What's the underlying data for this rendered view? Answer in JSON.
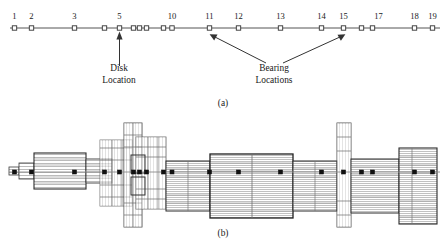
{
  "figure": {
    "panel_a": {
      "caption": "(a)",
      "description": "lumped-mass node line model of rotor",
      "node_labels": [
        {
          "id": "1",
          "x": 14.5
        },
        {
          "id": "2",
          "x": 31.5
        },
        {
          "id": "3",
          "x": 74.5
        },
        {
          "id": "5",
          "x": 119.5
        },
        {
          "id": "10",
          "x": 172.0
        },
        {
          "id": "11",
          "x": 209.5
        },
        {
          "id": "12",
          "x": 238.5
        },
        {
          "id": "13",
          "x": 280.5
        },
        {
          "id": "14",
          "x": 321.5
        },
        {
          "id": "15",
          "x": 343.5
        },
        {
          "id": "17",
          "x": 378.5
        },
        {
          "id": "18",
          "x": 414.5
        },
        {
          "id": "19",
          "x": 432.5
        }
      ],
      "node_marks_x": [
        14.5,
        31.5,
        74.5,
        104.5,
        119.5,
        133.5,
        139.5,
        146.5,
        163.5,
        172.0,
        209.5,
        238.5,
        280.5,
        321.5,
        343.5,
        361.5,
        372.5,
        414.5,
        432.5
      ],
      "axis_line": {
        "x1": 10.0,
        "x2": 440.0,
        "y": 28.0
      },
      "annotations": [
        {
          "name": "disk-location",
          "line1": "Disk",
          "line2": "Location",
          "text_x": 119.0,
          "text_y1": 70.0,
          "text_y2": 82.0,
          "arrow": {
            "x1": 119.5,
            "y1": 66.0,
            "x2": 119.5,
            "y2": 33.0
          }
        },
        {
          "name": "bearing-locations",
          "line1": "Bearing",
          "line2": "Locations",
          "text_x": 266.0,
          "text_y1": 70.0,
          "text_y2": 82.0,
          "arrows": [
            {
              "x1": 266.0,
              "y1": 64.0,
              "x2": 211.0,
              "y2": 33.5
            },
            {
              "x1": 283.0,
              "y1": 64.0,
              "x2": 344.5,
              "y2": 33.5
            }
          ]
        }
      ]
    },
    "panel_b": {
      "caption": "(b)",
      "description": "cross-sectional assembly drawing of rotor shaft with disks and bearings",
      "centerline_y": 172.0,
      "node_marks_x": [
        14.5,
        31.5,
        74.5,
        104.5,
        119.5,
        133.5,
        139.5,
        146.5,
        163.5,
        172.0,
        209.5,
        238.5,
        280.5,
        321.5,
        343.5,
        361.5,
        372.5,
        414.5,
        432.5
      ]
    }
  },
  "colors": {
    "ink": "#1a1a1a",
    "line": "#4a4a4a",
    "hatch": "#9a9a9a",
    "background": "#ffffff"
  }
}
